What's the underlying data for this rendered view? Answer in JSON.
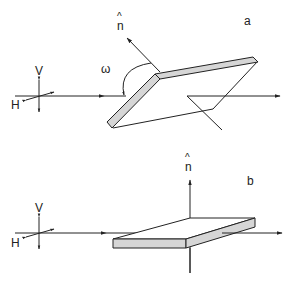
{
  "figure": {
    "panels": [
      {
        "id": "a",
        "label": "a",
        "normal_label": "n",
        "normal_hat": "^",
        "angle_label": "ω",
        "polarization": {
          "vertical_label": "V",
          "horizontal_label": "H"
        },
        "plate_orientation": "tilted"
      },
      {
        "id": "b",
        "label": "b",
        "normal_label": "n",
        "normal_hat": "^",
        "polarization": {
          "vertical_label": "V",
          "horizontal_label": "H"
        },
        "plate_orientation": "horizontal"
      }
    ],
    "colors": {
      "line": "#222222",
      "plate_edge_fill": "#d6d6d6",
      "background": "#ffffff"
    }
  }
}
